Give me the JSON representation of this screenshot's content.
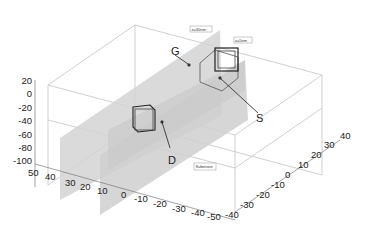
{
  "figure": {
    "annotations": {
      "G": "G",
      "S": "S",
      "D": "D"
    },
    "slice_labels": {
      "z30": "z=30nm",
      "z5": "z=5nm",
      "substrate": "Substrate"
    },
    "axes": {
      "z_ticks": [
        "20",
        "0",
        "-20",
        "-40",
        "-60",
        "-80",
        "-100"
      ],
      "x_ticks": [
        "50",
        "40",
        "30",
        "20",
        "10",
        "0",
        "-10",
        "-20",
        "-30",
        "-40",
        "-50"
      ],
      "y_ticks": [
        "-40",
        "-30",
        "-20",
        "-10",
        "0",
        "10",
        "20",
        "30",
        "40"
      ]
    },
    "colors": {
      "plane": "#d4d4d4",
      "edge": "#999999",
      "text": "#222222"
    }
  }
}
